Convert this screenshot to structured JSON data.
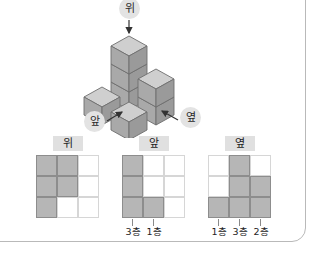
{
  "page": {
    "background_color": "#ffffff",
    "frame_color": "#b9b9b9"
  },
  "solid": {
    "type": "isometric-cube-stack",
    "cube_count": 6,
    "face_colors": {
      "top": "#cfcfcf",
      "left": "#a9a9a9",
      "right": "#9a9a9a",
      "edge": "#6e6e6e"
    },
    "direction_labels": [
      {
        "id": "top",
        "text": "위",
        "arrow": "down"
      },
      {
        "id": "front",
        "text": "앞",
        "arrow": "up-right"
      },
      {
        "id": "side",
        "text": "옆",
        "arrow": "up-left"
      }
    ]
  },
  "views": [
    {
      "id": "top-view",
      "title": "위",
      "rows": 3,
      "cols": 3,
      "filled": [
        [
          true,
          true,
          false
        ],
        [
          true,
          true,
          false
        ],
        [
          true,
          false,
          false
        ]
      ],
      "ticks": []
    },
    {
      "id": "front-view",
      "title": "앞",
      "rows": 3,
      "cols": 3,
      "filled": [
        [
          true,
          false,
          false
        ],
        [
          true,
          false,
          false
        ],
        [
          true,
          true,
          false
        ]
      ],
      "ticks": [
        {
          "col": 0,
          "label": "3층"
        },
        {
          "col": 1,
          "label": "1층"
        }
      ]
    },
    {
      "id": "side-view",
      "title": "옆",
      "rows": 3,
      "cols": 3,
      "filled": [
        [
          false,
          true,
          false
        ],
        [
          false,
          true,
          true
        ],
        [
          true,
          true,
          true
        ]
      ],
      "ticks": [
        {
          "col": 0,
          "label": "1층"
        },
        {
          "col": 1,
          "label": "3층"
        },
        {
          "col": 2,
          "label": "2층"
        }
      ]
    }
  ]
}
